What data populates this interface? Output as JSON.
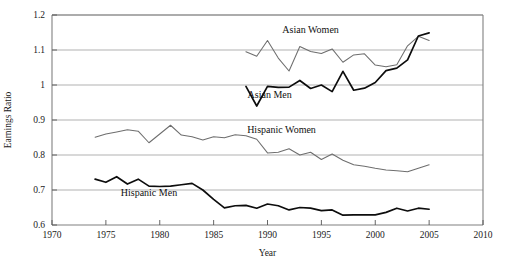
{
  "chart_data": {
    "type": "line",
    "title": "",
    "xlabel": "Year",
    "ylabel": "Earnings Ratio",
    "xlim": [
      1970,
      2010
    ],
    "ylim": [
      0.6,
      1.2
    ],
    "xticks": [
      1970,
      1975,
      1980,
      1985,
      1990,
      1995,
      2000,
      2005,
      2010
    ],
    "yticks": [
      0.6,
      0.7,
      0.8,
      0.9,
      1.0,
      1.1,
      1.2
    ],
    "xtick_labels": [
      "1970",
      "1975",
      "1980",
      "1985",
      "1990",
      "1995",
      "2000",
      "2005",
      "2010"
    ],
    "ytick_labels": [
      "0.6",
      "0.7",
      "0.8",
      "0.9",
      "1",
      "1.1",
      "1.2"
    ],
    "grid": true,
    "grid_axis": "y",
    "legend": "inline-annotations",
    "series": [
      {
        "name": "Asian Women",
        "style": "thin-gray",
        "color": "#6e6e6e",
        "label_x": 1994.0,
        "label_y": 1.148,
        "x": [
          1988,
          1989,
          1990,
          1991,
          1992,
          1993,
          1994,
          1995,
          1996,
          1997,
          1998,
          1999,
          2000,
          2001,
          2002,
          2003,
          2004,
          2005
        ],
        "y": [
          1.095,
          1.082,
          1.127,
          1.077,
          1.04,
          1.11,
          1.096,
          1.09,
          1.103,
          1.065,
          1.086,
          1.089,
          1.057,
          1.052,
          1.058,
          1.112,
          1.139,
          1.127
        ]
      },
      {
        "name": "Asian Men",
        "style": "thick-black",
        "color": "#0d0d0d",
        "label_x": 1990.2,
        "label_y": 0.962,
        "x": [
          1988,
          1989,
          1990,
          1991,
          1992,
          1993,
          1994,
          1995,
          1996,
          1997,
          1998,
          1999,
          2000,
          2001,
          2002,
          2003,
          2004,
          2005
        ],
        "y": [
          0.996,
          0.94,
          0.996,
          0.993,
          0.994,
          1.013,
          0.99,
          1.0,
          0.981,
          1.039,
          0.985,
          0.991,
          1.007,
          1.041,
          1.048,
          1.072,
          1.14,
          1.149
        ]
      },
      {
        "name": "Hispanic Women",
        "style": "thin-gray",
        "color": "#6e6e6e",
        "label_x": 1991.3,
        "label_y": 0.862,
        "x": [
          1974,
          1975,
          1976,
          1977,
          1978,
          1979,
          1980,
          1981,
          1982,
          1983,
          1984,
          1985,
          1986,
          1987,
          1988,
          1989,
          1990,
          1991,
          1992,
          1993,
          1994,
          1995,
          1996,
          1997,
          1998,
          1999,
          2000,
          2001,
          2002,
          2003,
          2004,
          2005
        ],
        "y": [
          0.851,
          0.86,
          0.866,
          0.872,
          0.868,
          0.835,
          0.86,
          0.885,
          0.857,
          0.852,
          0.843,
          0.852,
          0.849,
          0.858,
          0.855,
          0.845,
          0.806,
          0.808,
          0.818,
          0.8,
          0.808,
          0.787,
          0.803,
          0.785,
          0.772,
          0.768,
          0.762,
          0.757,
          0.755,
          0.752,
          0.762,
          0.772
        ]
      },
      {
        "name": "Hispanic Men",
        "style": "thick-black",
        "color": "#0d0d0d",
        "label_x": 1979.0,
        "label_y": 0.682,
        "x": [
          1974,
          1975,
          1976,
          1977,
          1978,
          1979,
          1980,
          1981,
          1982,
          1983,
          1984,
          1985,
          1986,
          1987,
          1988,
          1989,
          1990,
          1991,
          1992,
          1993,
          1994,
          1995,
          1996,
          1997,
          1998,
          1999,
          2000,
          2001,
          2002,
          2003,
          2004,
          2005
        ],
        "y": [
          0.731,
          0.722,
          0.738,
          0.717,
          0.731,
          0.711,
          0.71,
          0.711,
          0.715,
          0.719,
          0.7,
          0.673,
          0.649,
          0.655,
          0.656,
          0.648,
          0.66,
          0.655,
          0.643,
          0.65,
          0.648,
          0.641,
          0.643,
          0.628,
          0.629,
          0.629,
          0.629,
          0.636,
          0.648,
          0.64,
          0.648,
          0.645
        ]
      }
    ]
  }
}
